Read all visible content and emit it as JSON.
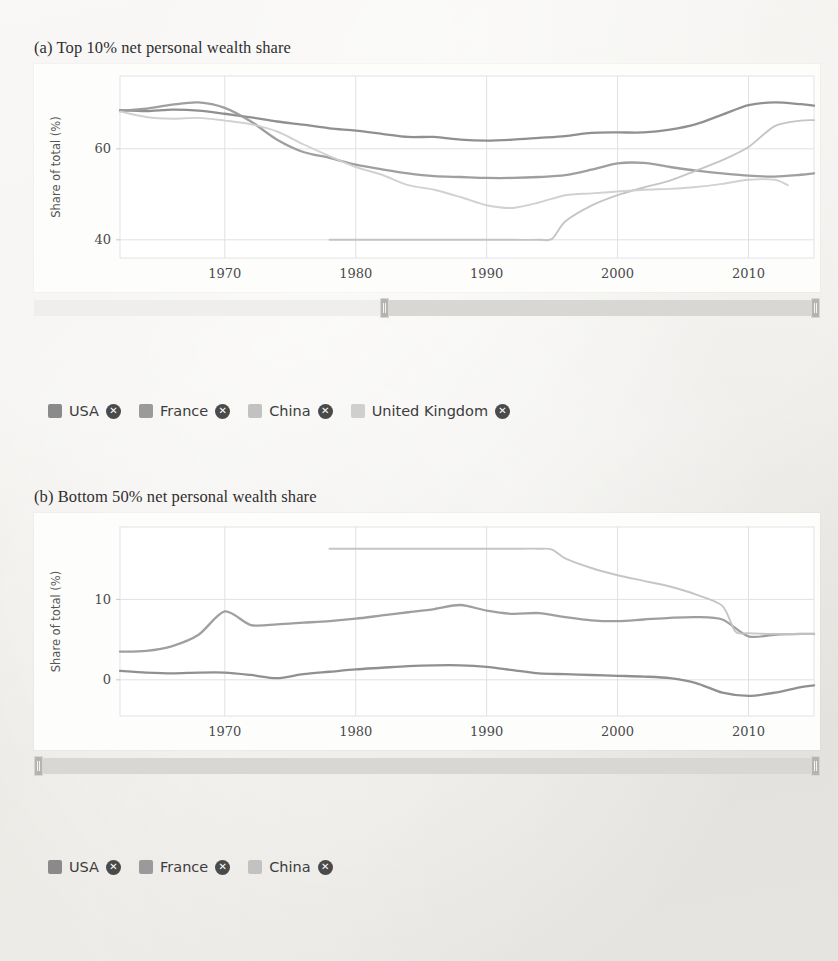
{
  "figures": [
    {
      "id": "fig-a",
      "title": "(a) Top 10% net personal wealth share",
      "ylabel": "Share of total (%)",
      "yticks": [
        40,
        60
      ],
      "xticks": [
        1970,
        1980,
        1990,
        2000,
        2010
      ],
      "legend": [
        {
          "label": "USA",
          "color": "#8a8a8a",
          "close": "✕"
        },
        {
          "label": "France",
          "color": "#9a9a9a",
          "close": "✕"
        },
        {
          "label": "China",
          "color": "#c2c2c2",
          "close": "✕"
        },
        {
          "label": "United Kingdom",
          "color": "#cfcfcf",
          "close": "✕"
        }
      ],
      "slider": {
        "left_pct": 44.0,
        "right_pct": 100.0
      }
    },
    {
      "id": "fig-b",
      "title": "(b) Bottom 50% net personal wealth share",
      "ylabel": "Share of total (%)",
      "yticks": [
        0,
        10
      ],
      "xticks": [
        1970,
        1980,
        1990,
        2000,
        2010
      ],
      "legend": [
        {
          "label": "USA",
          "color": "#8a8a8a",
          "close": "✕"
        },
        {
          "label": "France",
          "color": "#9a9a9a",
          "close": "✕"
        },
        {
          "label": "China",
          "color": "#c2c2c2",
          "close": "✕"
        }
      ],
      "slider": {
        "left_pct": 0.0,
        "right_pct": 100.0
      }
    }
  ],
  "chart_data": [
    {
      "type": "line",
      "title": "(a) Top 10% net personal wealth share",
      "xlabel": "",
      "ylabel": "Share of total (%)",
      "xlim": [
        1962,
        2015
      ],
      "ylim": [
        36,
        76
      ],
      "yticks": [
        40,
        60
      ],
      "xticks": [
        1970,
        1980,
        1990,
        2000,
        2010
      ],
      "grid": true,
      "legend_position": "below",
      "series": [
        {
          "name": "USA",
          "color": "#8a8a8a",
          "x": [
            1962,
            1964,
            1966,
            1968,
            1970,
            1972,
            1974,
            1976,
            1978,
            1980,
            1982,
            1984,
            1986,
            1988,
            1990,
            1992,
            1994,
            1996,
            1998,
            2000,
            2002,
            2004,
            2006,
            2008,
            2010,
            2012,
            2014,
            2015
          ],
          "values": [
            68.5,
            68.3,
            68.6,
            68.4,
            67.7,
            66.9,
            66.0,
            65.3,
            64.5,
            64.0,
            63.3,
            62.6,
            62.6,
            62.0,
            61.8,
            62.0,
            62.4,
            62.8,
            63.5,
            63.6,
            63.6,
            64.2,
            65.4,
            67.5,
            69.6,
            70.2,
            69.8,
            69.5
          ]
        },
        {
          "name": "France",
          "color": "#9a9a9a",
          "x": [
            1962,
            1964,
            1966,
            1968,
            1970,
            1972,
            1974,
            1976,
            1978,
            1980,
            1982,
            1984,
            1986,
            1988,
            1990,
            1992,
            1994,
            1996,
            1998,
            2000,
            2002,
            2004,
            2006,
            2008,
            2010,
            2012,
            2014,
            2015
          ],
          "values": [
            68.3,
            68.8,
            69.7,
            70.2,
            69.0,
            66.0,
            62.0,
            59.3,
            58.0,
            56.5,
            55.5,
            54.6,
            54.0,
            53.8,
            53.6,
            53.6,
            53.8,
            54.2,
            55.4,
            56.8,
            56.9,
            56.0,
            55.2,
            54.6,
            54.1,
            53.9,
            54.3,
            54.6
          ]
        },
        {
          "name": "China",
          "color": "#c2c2c2",
          "x": [
            1978,
            1980,
            1982,
            1984,
            1986,
            1988,
            1990,
            1992,
            1994,
            1995,
            1996,
            1998,
            2000,
            2002,
            2004,
            2006,
            2008,
            2010,
            2012,
            2014,
            2015
          ],
          "values": [
            40.0,
            40.0,
            40.0,
            40.0,
            40.0,
            40.0,
            40.0,
            40.0,
            40.0,
            40.2,
            44.0,
            47.5,
            49.8,
            51.5,
            53.0,
            55.2,
            57.5,
            60.4,
            65.0,
            66.2,
            66.3
          ]
        },
        {
          "name": "United Kingdom",
          "color": "#cfcfcf",
          "x": [
            1962,
            1964,
            1966,
            1968,
            1970,
            1972,
            1974,
            1976,
            1978,
            1980,
            1982,
            1984,
            1986,
            1988,
            1990,
            1992,
            1994,
            1996,
            1998,
            2000,
            2002,
            2004,
            2006,
            2008,
            2010,
            2012,
            2013
          ],
          "values": [
            68.2,
            67.0,
            66.6,
            66.8,
            66.2,
            65.4,
            63.8,
            61.0,
            58.4,
            56.0,
            54.3,
            52.0,
            51.0,
            49.4,
            47.6,
            47.0,
            48.2,
            49.8,
            50.2,
            50.6,
            51.0,
            51.2,
            51.6,
            52.3,
            53.2,
            53.2,
            52.0
          ]
        }
      ]
    },
    {
      "type": "line",
      "title": "(b) Bottom 50% net personal wealth share",
      "xlabel": "",
      "ylabel": "Share of total (%)",
      "xlim": [
        1962,
        2015
      ],
      "ylim": [
        -4.5,
        19
      ],
      "yticks": [
        0,
        10
      ],
      "xticks": [
        1970,
        1980,
        1990,
        2000,
        2010
      ],
      "grid": true,
      "legend_position": "below",
      "series": [
        {
          "name": "USA",
          "color": "#8a8a8a",
          "x": [
            1962,
            1964,
            1966,
            1968,
            1970,
            1972,
            1974,
            1976,
            1978,
            1980,
            1982,
            1984,
            1986,
            1988,
            1990,
            1992,
            1994,
            1996,
            1998,
            2000,
            2002,
            2004,
            2006,
            2008,
            2010,
            2012,
            2014,
            2015
          ],
          "values": [
            1.1,
            0.9,
            0.8,
            0.9,
            0.9,
            0.6,
            0.2,
            0.7,
            1.0,
            1.3,
            1.5,
            1.7,
            1.8,
            1.8,
            1.6,
            1.2,
            0.8,
            0.7,
            0.6,
            0.5,
            0.4,
            0.2,
            -0.4,
            -1.6,
            -2.0,
            -1.6,
            -0.9,
            -0.7
          ]
        },
        {
          "name": "France",
          "color": "#9a9a9a",
          "x": [
            1962,
            1964,
            1966,
            1968,
            1970,
            1972,
            1974,
            1976,
            1978,
            1980,
            1982,
            1984,
            1986,
            1988,
            1990,
            1992,
            1994,
            1996,
            1998,
            2000,
            2002,
            2004,
            2006,
            2008,
            2010,
            2012,
            2014,
            2015
          ],
          "values": [
            3.5,
            3.6,
            4.2,
            5.6,
            8.5,
            6.8,
            6.9,
            7.1,
            7.3,
            7.6,
            8.0,
            8.4,
            8.8,
            9.3,
            8.6,
            8.2,
            8.3,
            7.8,
            7.4,
            7.3,
            7.5,
            7.7,
            7.8,
            7.5,
            5.4,
            5.6,
            5.7,
            5.7
          ]
        },
        {
          "name": "China",
          "color": "#c2c2c2",
          "x": [
            1978,
            1980,
            1982,
            1984,
            1986,
            1988,
            1990,
            1992,
            1994,
            1995,
            1996,
            1998,
            2000,
            2002,
            2004,
            2006,
            2008,
            2009,
            2010,
            2012,
            2014,
            2015
          ],
          "values": [
            16.3,
            16.3,
            16.3,
            16.3,
            16.3,
            16.3,
            16.3,
            16.3,
            16.3,
            16.2,
            15.1,
            13.9,
            13.0,
            12.3,
            11.6,
            10.6,
            9.2,
            6.0,
            5.8,
            5.7,
            5.7,
            5.7
          ]
        }
      ]
    }
  ]
}
